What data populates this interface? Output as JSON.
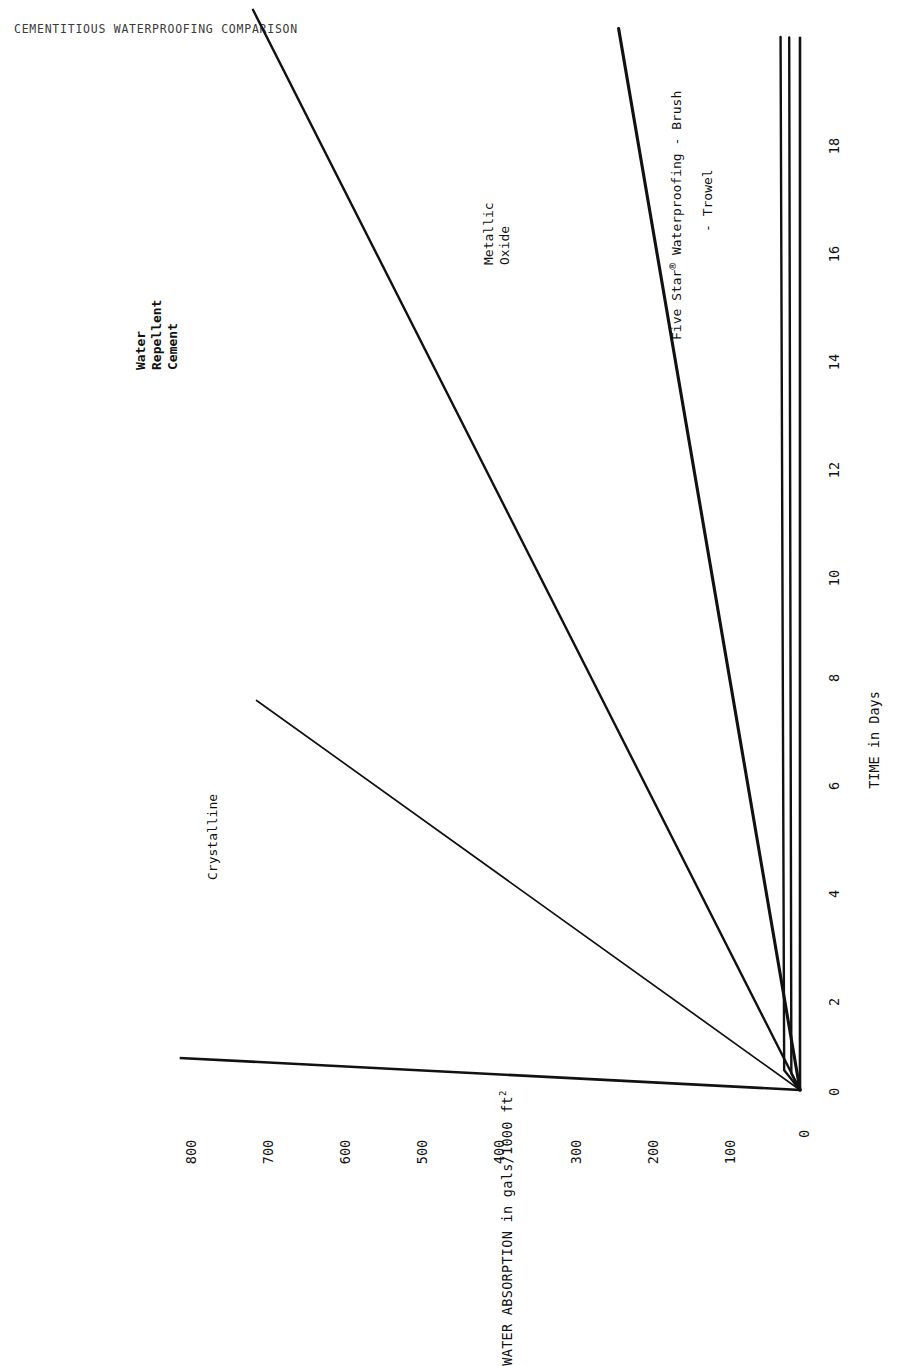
{
  "document": {
    "title": "CEMENTITIOUS WATERPROOFING COMPARISON"
  },
  "chart_data": {
    "type": "line",
    "title": "CEMENTITIOUS WATERPROOFING COMPARISON",
    "xlabel": "TIME in Days",
    "ylabel": "WATER ABSORPTION in gals/1000 ft",
    "ylabel_superscript": "2",
    "xlim": [
      0,
      19.5
    ],
    "ylim": [
      0,
      860
    ],
    "xticks": [
      0,
      2,
      4,
      6,
      8,
      10,
      12,
      14,
      16,
      18
    ],
    "xtick_labels": [
      "0",
      "2",
      "4",
      "6",
      "8",
      "10",
      "12",
      "14",
      "16",
      "18"
    ],
    "yticks": [
      0,
      100,
      200,
      300,
      400,
      500,
      600,
      700,
      800
    ],
    "ytick_labels": [
      "0",
      "100",
      "200",
      "300",
      "400",
      "500",
      "600",
      "700",
      "800"
    ],
    "grid": false,
    "legend": "inline-annotations",
    "series": [
      {
        "name": "Crystalline",
        "label": "Crystalline",
        "style": "thin",
        "x": [
          0,
          6.7
        ],
        "y": [
          0,
          755
        ]
      },
      {
        "name": "Water Repellent Cement",
        "label": "Water Repellent Cement",
        "label_lines": [
          "Water",
          "Repellent",
          "Cement"
        ],
        "bold_label": true,
        "style": "medium",
        "x": [
          0,
          19.5
        ],
        "y": [
          0,
          760
        ]
      },
      {
        "name": "Metallic Oxide",
        "label": "Metallic Oxide",
        "label_lines": [
          "Metallic",
          "Oxide"
        ],
        "style": "thick",
        "x": [
          0,
          19.5
        ],
        "y": [
          0,
          252
        ]
      },
      {
        "name": "Five Star Waterproofing - Brush",
        "label": "Five Star",
        "label_suffix": " Waterproofing - Brush",
        "registered": "®",
        "style": "medium",
        "x": [
          0,
          0.35,
          19.5
        ],
        "y": [
          0,
          22,
          27
        ]
      },
      {
        "name": "Five Star Waterproofing - Trowel",
        "label": "- Trowel",
        "style": "medium",
        "x": [
          0,
          0.3,
          19.5
        ],
        "y": [
          0,
          12,
          15
        ]
      }
    ]
  },
  "labels": {
    "crystalline": "Crystalline",
    "water_repellent_1": "Water",
    "water_repellent_2": "Repellent",
    "water_repellent_3": "Cement",
    "metallic_1": "Metallic",
    "metallic_2": "Oxide",
    "five_star_brush_a": "Five Star",
    "five_star_brush_reg": "®",
    "five_star_brush_b": "Waterproofing - Brush",
    "five_star_trowel": "- Trowel"
  },
  "axis": {
    "x_title": "TIME in Days",
    "y_title": "WATER ABSORPTION in gals/1000 ft",
    "y_title_sup": "2"
  },
  "colors": {
    "ink": "#111111",
    "paper": "#ffffff"
  }
}
